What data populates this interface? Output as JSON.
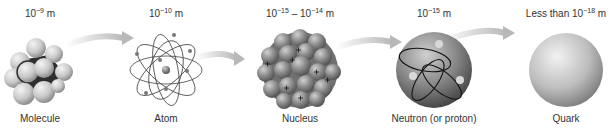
{
  "diagram": {
    "type": "scale-of-matter",
    "stages": [
      {
        "name": "Molecule",
        "scale_prefix": "",
        "scale_base": "10",
        "scale_exp": "−9",
        "scale_mid": "",
        "scale_base2": "",
        "scale_exp2": "",
        "scale_unit": " m",
        "center_x": 40
      },
      {
        "name": "Atom",
        "scale_prefix": "",
        "scale_base": "10",
        "scale_exp": "−10",
        "scale_mid": "",
        "scale_base2": "",
        "scale_exp2": "",
        "scale_unit": " m",
        "center_x": 166
      },
      {
        "name": "Nucleus",
        "scale_prefix": "",
        "scale_base": "10",
        "scale_exp": "−15",
        "scale_mid": " – ",
        "scale_base2": "10",
        "scale_exp2": "−14",
        "scale_unit": " m",
        "center_x": 300
      },
      {
        "name": "Neutron (or proton)",
        "scale_prefix": "",
        "scale_base": "10",
        "scale_exp": "−15",
        "scale_mid": "",
        "scale_base2": "",
        "scale_exp2": "",
        "scale_unit": " m",
        "center_x": 434
      },
      {
        "name": "Quark",
        "scale_prefix": "Less than ",
        "scale_base": "10",
        "scale_exp": "−18",
        "scale_mid": "",
        "scale_base2": "",
        "scale_exp2": "",
        "scale_unit": " m",
        "center_x": 566
      }
    ],
    "arrows": [
      {
        "from": "Molecule",
        "to": "Atom"
      },
      {
        "from": "Atom",
        "to": "Nucleus"
      },
      {
        "from": "Nucleus",
        "to": "Neutron (or proton)"
      },
      {
        "from": "Neutron (or proton)",
        "to": "Quark"
      }
    ],
    "colors": {
      "arrow": "#c8c8c8",
      "sphere_light": "#e6e6e6",
      "sphere_dark": "#6a6a6a",
      "text": "#333333"
    }
  }
}
